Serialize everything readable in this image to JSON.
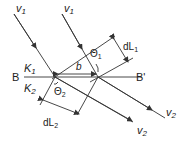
{
  "diagram": {
    "colors": {
      "line": "#333333",
      "text": "#222222",
      "background": "#ffffff"
    },
    "labels": {
      "v1_left": "v",
      "v1_left_sub": "1",
      "v1_right": "v",
      "v1_right_sub": "1",
      "k1": "K",
      "k1_sub": "1",
      "k2": "K",
      "k2_sub": "2",
      "b_left": "B",
      "b_right": "B'",
      "b_dist": "b",
      "theta1": "Θ",
      "theta1_sub": "1",
      "theta2": "Θ",
      "theta2_sub": "2",
      "dl1": "dL",
      "dl1_sub": "1",
      "dl2": "dL",
      "dl2_sub": "2",
      "v2_lower": "v",
      "v2_lower_sub": "2",
      "v2_right": "v",
      "v2_right_sub": "2"
    }
  }
}
